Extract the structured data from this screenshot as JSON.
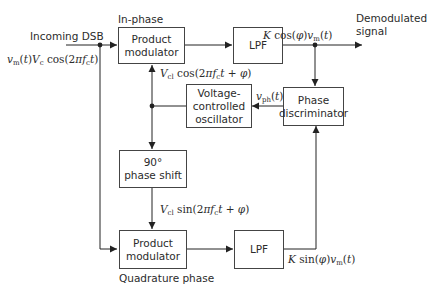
{
  "diagram": {
    "input": {
      "title": "Incoming DSB",
      "signal": "v_m(t)V_c cos(2πf_c t)"
    },
    "blocks": {
      "top_modulator": {
        "line1": "Product",
        "line2": "modulator",
        "caption": "In-phase"
      },
      "top_lpf": {
        "label": "LPF"
      },
      "vco": {
        "line1": "Voltage-",
        "line2": "controlled",
        "line3": "oscillator"
      },
      "phase_discriminator": {
        "line1": "Phase",
        "line2": "discriminator"
      },
      "phase_shift": {
        "line1": "90°",
        "line2": "phase shift"
      },
      "bottom_modulator": {
        "line1": "Product",
        "line2": "modulator",
        "caption": "Quadrature phase"
      },
      "bottom_lpf": {
        "label": "LPF"
      }
    },
    "signals": {
      "output_title_1": "Demodulated",
      "output_title_2": "signal",
      "top_lpf_out": "K cos(φ)v_m(t)",
      "vco_cos": "V_cl cos(2πf_c t + φ)",
      "vco_sin": "V_cl sin(2πf_c t + φ)",
      "vph": "v_ph(t)",
      "bottom_lpf_out": "K sin(φ)v_m(t)"
    },
    "colors": {
      "line": "#222222",
      "box_border": "#444444",
      "text": "#2b2b2b"
    }
  }
}
